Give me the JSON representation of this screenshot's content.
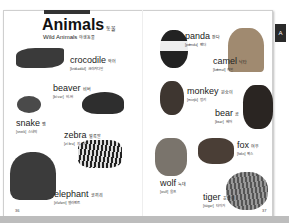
{
  "page": {
    "title": "Animals",
    "title_ko": "동물",
    "subtitle": "Wild Animals",
    "subtitle_ko": "야생동물",
    "tab_label": "A",
    "page_left": "36",
    "page_right": "37"
  },
  "entries": [
    {
      "id": "crocodile",
      "word": "crocodile",
      "ko": "악어",
      "pron": "[krɑ́kədàil]",
      "pron_ko": "크라커다일"
    },
    {
      "id": "beaver",
      "word": "beaver",
      "ko": "비버",
      "pron": "[bíːvər]",
      "pron_ko": "비-버"
    },
    {
      "id": "snake",
      "word": "snake",
      "ko": "뱀",
      "pron": "[sneik]",
      "pron_ko": "스네익"
    },
    {
      "id": "zebra",
      "word": "zebra",
      "ko": "얼룩말",
      "pron": "[zíːbrə]",
      "pron_ko": "지-브러"
    },
    {
      "id": "elephant",
      "word": "elephant",
      "ko": "코끼리",
      "pron": "[éləfənt]",
      "pron_ko": "엘러펀트"
    },
    {
      "id": "panda",
      "word": "panda",
      "ko": "판다",
      "pron": "[pǽndə]",
      "pron_ko": "팬더"
    },
    {
      "id": "camel",
      "word": "camel",
      "ko": "낙타",
      "pron": "[kǽməl]",
      "pron_ko": "캐멀"
    },
    {
      "id": "monkey",
      "word": "monkey",
      "ko": "원숭이",
      "pron": "[mʌ́ŋki]",
      "pron_ko": "멍키"
    },
    {
      "id": "bear",
      "word": "bear",
      "ko": "곰",
      "pron": "[bɛər]",
      "pron_ko": "베어"
    },
    {
      "id": "fox",
      "word": "fox",
      "ko": "여우",
      "pron": "[fɑks]",
      "pron_ko": "팍스"
    },
    {
      "id": "wolf",
      "word": "wolf",
      "ko": "늑대",
      "pron": "[wulf]",
      "pron_ko": "울프"
    },
    {
      "id": "tiger",
      "word": "tiger",
      "ko": "호랑이",
      "pron": "[táigər]",
      "pron_ko": "타이거"
    }
  ]
}
